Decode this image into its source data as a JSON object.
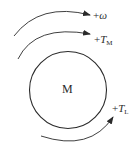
{
  "diagram": {
    "type": "machine-torque-sign-convention",
    "center_label": "M",
    "labels": {
      "omega": {
        "sign": "+",
        "symbol": "ω",
        "sub": ""
      },
      "tm": {
        "sign": "+",
        "symbol": "T",
        "sub": "M"
      },
      "tl": {
        "sign": "+",
        "symbol": "T",
        "sub": "L"
      }
    },
    "colors": {
      "stroke": "#2a2a2a",
      "background": "#ffffff"
    }
  }
}
